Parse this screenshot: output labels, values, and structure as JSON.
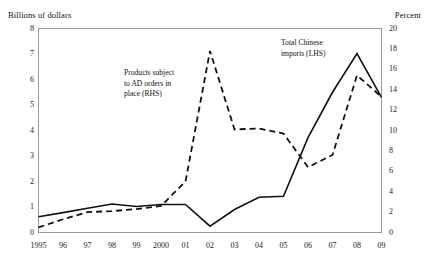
{
  "chart_data": {
    "type": "line",
    "title": "",
    "xlabel": "",
    "ylabel": "Billions of dollars",
    "y2label": "Percent",
    "grid": false,
    "legend_position": "inline-annotations",
    "categories": [
      "1995",
      "96",
      "97",
      "98",
      "99",
      "2000",
      "01",
      "02",
      "03",
      "04",
      "05",
      "06",
      "07",
      "08",
      "09"
    ],
    "x": [
      1995,
      1996,
      1997,
      1998,
      1999,
      2000,
      2001,
      2002,
      2003,
      2004,
      2005,
      2006,
      2007,
      2008,
      2009
    ],
    "ylim": [
      0,
      8
    ],
    "y2lim": [
      0,
      20
    ],
    "yticks": [
      0,
      1,
      2,
      3,
      4,
      5,
      6,
      7,
      8
    ],
    "y2ticks": [
      0,
      2,
      4,
      6,
      8,
      10,
      12,
      14,
      16,
      18,
      20
    ],
    "series": [
      {
        "name": "Total Chinese imports (LHS)",
        "axis": "left",
        "style": "solid",
        "color": "#111111",
        "values": [
          0.62,
          0.78,
          0.95,
          1.12,
          1.02,
          1.1,
          1.1,
          0.25,
          0.9,
          1.38,
          1.42,
          3.72,
          5.5,
          7.02,
          5.3
        ]
      },
      {
        "name": "Products subject to AD orders in place (RHS)",
        "axis": "right",
        "style": "dashed",
        "color": "#111111",
        "values": [
          0.5,
          1.3,
          2.0,
          2.1,
          2.3,
          2.6,
          5.0,
          17.8,
          10.1,
          10.2,
          9.7,
          6.4,
          7.6,
          15.4,
          13.3
        ]
      }
    ],
    "annotations": [
      {
        "text_line1": "Products subject",
        "text_line2": "to AD orders in",
        "text_line3": "place (RHS)"
      },
      {
        "text_line1": "Total Chinese",
        "text_line2": "imports (LHS)"
      }
    ]
  },
  "axes": {
    "left_title": "Billions of dollars",
    "right_title": "Percent",
    "left_ticks": [
      "8",
      "7",
      "6",
      "5",
      "4",
      "3",
      "2",
      "1",
      "0"
    ],
    "right_ticks": [
      "20",
      "18",
      "16",
      "14",
      "12",
      "10",
      "8",
      "6",
      "4",
      "2",
      "0"
    ],
    "x_ticks": [
      "1995",
      "96",
      "97",
      "98",
      "99",
      "2000",
      "01",
      "02",
      "03",
      "04",
      "05",
      "06",
      "07",
      "08",
      "09"
    ]
  },
  "annotations": {
    "rhs_label_l1": "Products subject",
    "rhs_label_l2": "to AD orders in",
    "rhs_label_l3": "place (RHS)",
    "lhs_label_l1": "Total Chinese",
    "lhs_label_l2": "imports (LHS)"
  },
  "colors": {
    "series_line": "#111111",
    "frame": "#9a9a9a",
    "background": "#ffffff",
    "text": "#1a1a1a"
  }
}
